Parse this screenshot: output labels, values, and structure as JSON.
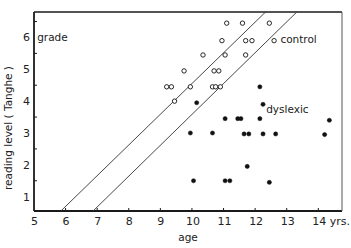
{
  "chart_data": {
    "type": "scatter",
    "title": "",
    "xlabel": "age",
    "ylabel": "reading level ( Tanghe )",
    "xlim": [
      5,
      14.75
    ],
    "ylim": [
      0.55,
      6.8
    ],
    "x_ticks": [
      5,
      6,
      7,
      8,
      9,
      10,
      11,
      12,
      13,
      14
    ],
    "x_tick_labels": [
      "5",
      "6",
      "7",
      "8",
      "9",
      "10",
      "11",
      "12",
      "13",
      "14 yrs."
    ],
    "y_ticks": [
      1,
      2,
      3,
      4,
      5,
      6
    ],
    "y_tick_labels": [
      "1",
      "2",
      "3",
      "4",
      "5",
      "6"
    ],
    "y_unit_label": "grade",
    "grid": false,
    "legend": null,
    "annotations": [
      {
        "text": "control",
        "x": 12.8,
        "y": 5.95
      },
      {
        "text": "dyslexic",
        "x": 12.35,
        "y": 3.75
      },
      {
        "text": "grade",
        "x": 5.1,
        "y": 6.0
      }
    ],
    "reference_lines": [
      {
        "name": "band-lower-bound",
        "x1": 5.85,
        "y1": 0.55,
        "x2": 12.33,
        "y2": 6.8
      },
      {
        "name": "band-upper-bound",
        "x1": 6.87,
        "y1": 0.55,
        "x2": 13.32,
        "y2": 6.8
      }
    ],
    "series": [
      {
        "name": "control",
        "marker": "open-circle",
        "points": [
          [
            11.1,
            6.45
          ],
          [
            11.6,
            6.45
          ],
          [
            12.45,
            6.45
          ],
          [
            10.95,
            5.9
          ],
          [
            11.7,
            5.9
          ],
          [
            11.9,
            5.9
          ],
          [
            12.6,
            5.9
          ],
          [
            10.35,
            5.45
          ],
          [
            11.05,
            5.45
          ],
          [
            11.7,
            5.45
          ],
          [
            9.75,
            4.95
          ],
          [
            10.7,
            4.95
          ],
          [
            10.85,
            4.95
          ],
          [
            9.2,
            4.45
          ],
          [
            9.35,
            4.45
          ],
          [
            9.95,
            4.45
          ],
          [
            10.65,
            4.45
          ],
          [
            10.75,
            4.45
          ],
          [
            10.9,
            4.45
          ],
          [
            9.45,
            4.0
          ]
        ]
      },
      {
        "name": "dyslexic",
        "marker": "filled-circle",
        "points": [
          [
            12.15,
            4.45
          ],
          [
            10.15,
            3.95
          ],
          [
            12.25,
            3.9
          ],
          [
            11.05,
            3.45
          ],
          [
            11.45,
            3.45
          ],
          [
            11.55,
            3.45
          ],
          [
            12.15,
            3.45
          ],
          [
            14.35,
            3.4
          ],
          [
            9.95,
            3.0
          ],
          [
            10.65,
            3.0
          ],
          [
            11.65,
            2.97
          ],
          [
            11.8,
            2.97
          ],
          [
            12.25,
            2.97
          ],
          [
            12.65,
            2.97
          ],
          [
            14.2,
            2.95
          ],
          [
            11.75,
            1.95
          ],
          [
            10.05,
            1.5
          ],
          [
            11.05,
            1.5
          ],
          [
            11.2,
            1.5
          ],
          [
            12.45,
            1.45
          ]
        ]
      }
    ]
  },
  "colors": {
    "axis": "#1a1a1a",
    "marker": "#111111",
    "line": "#333333",
    "background": "#ffffff"
  }
}
